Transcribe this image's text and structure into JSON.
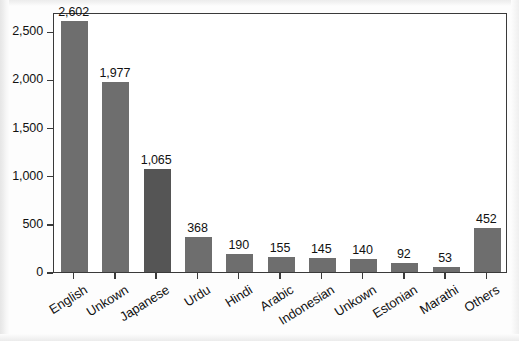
{
  "chart_data": {
    "type": "bar",
    "title": "",
    "subtitle": "",
    "xlabel": "",
    "ylabel": "",
    "categories": [
      "English",
      "Unkown",
      "Japanese",
      "Urdu",
      "Hindi",
      "Arabic",
      "Indonesian",
      "Unkown",
      "Estonian",
      "Marathi",
      "Others"
    ],
    "values": [
      2602,
      1977,
      1065,
      368,
      190,
      155,
      145,
      140,
      92,
      53,
      452
    ],
    "value_labels": [
      "2,602",
      "1,977",
      "1,065",
      "368",
      "190",
      "155",
      "145",
      "140",
      "92",
      "53",
      "452"
    ],
    "ylim": [
      0,
      2700
    ],
    "yticks": [
      0,
      500,
      1000,
      1500,
      2000,
      2500
    ],
    "ytick_labels": [
      "0",
      "500",
      "1,000",
      "1,500",
      "2,000",
      "2,500"
    ],
    "grid": false,
    "legend": false,
    "legend_position": "none",
    "bar_color": "#6e6e6e",
    "highlight_color": "#555555",
    "highlight_index": 2,
    "axis_color": "#3a3a3a",
    "text_color": "#111111",
    "background_color": "#ffffff",
    "xtick_label_rotation_deg": 32
  }
}
